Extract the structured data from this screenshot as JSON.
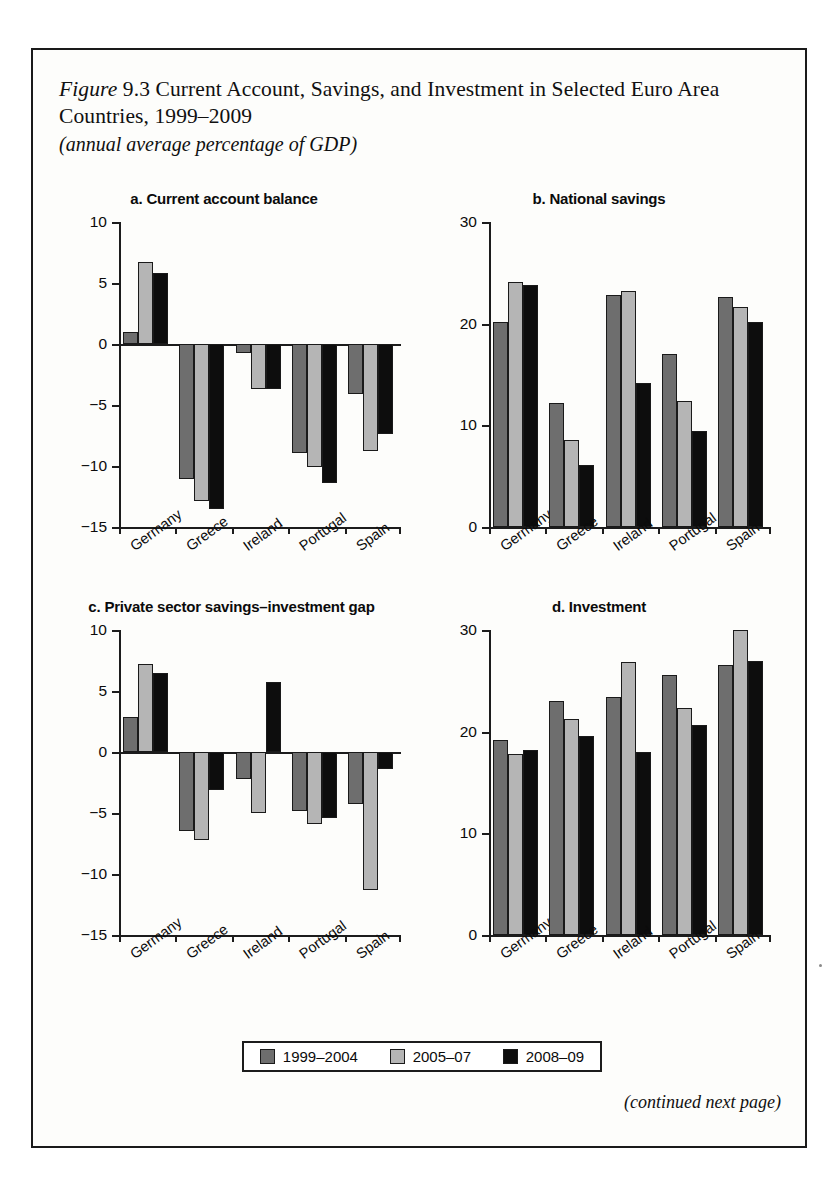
{
  "figure": {
    "label": "Figure",
    "number": "9.3",
    "title": "Current Account, Savings, and Investment in Selected Euro Area Countries, 1999–2009",
    "subtitle": "(annual average percentage of GDP)",
    "caption_line1": "Figure 9.3 Current Account, Savings, and Investment in",
    "caption_line2": "Selected Euro Area Countries, 1999–2009",
    "continued_note": "(continued next page)"
  },
  "legend": {
    "position": "bottom-center",
    "items": [
      {
        "label": "1999–2004",
        "color": "#6e6e6e"
      },
      {
        "label": "2005–07",
        "color": "#b5b5b5"
      },
      {
        "label": "2008–09",
        "color": "#0d0d0d"
      }
    ]
  },
  "colors": {
    "series1": "#6e6e6e",
    "series2": "#b5b5b5",
    "series3": "#0d0d0d",
    "axis": "#1c1c1c",
    "text": "#0b0b0b",
    "frame": "#1a1a1a"
  },
  "chart_data": [
    {
      "id": "panel-a",
      "type": "bar",
      "title": "a. Current account balance",
      "xlabel": "",
      "ylabel": "",
      "ylim": [
        -15,
        10
      ],
      "yticks": [
        10,
        5,
        0,
        -5,
        -10,
        -15
      ],
      "ytick_labels": [
        "10",
        "5",
        "0",
        "−5",
        "−10",
        "−15"
      ],
      "grid": false,
      "categories": [
        "Germany",
        "Greece",
        "Ireland",
        "Portugal",
        "Spain"
      ],
      "series": [
        {
          "name": "1999–2004",
          "values": [
            1.0,
            -11.1,
            -0.7,
            -8.9,
            -4.1
          ]
        },
        {
          "name": "2005–07",
          "values": [
            6.7,
            -12.9,
            -3.7,
            -10.1,
            -8.8
          ]
        },
        {
          "name": "2008–09",
          "values": [
            5.8,
            -13.5,
            -3.7,
            -11.4,
            -7.4
          ]
        }
      ]
    },
    {
      "id": "panel-b",
      "type": "bar",
      "title": "b. National savings",
      "xlabel": "",
      "ylabel": "",
      "ylim": [
        0,
        30
      ],
      "yticks": [
        30,
        20,
        10,
        0
      ],
      "ytick_labels": [
        "30",
        "20",
        "10",
        "0"
      ],
      "grid": false,
      "categories": [
        "Germany",
        "Greece",
        "Ireland",
        "Portugal",
        "Spain"
      ],
      "series": [
        {
          "name": "1999–2004",
          "values": [
            20.2,
            12.2,
            22.8,
            17.0,
            22.6
          ]
        },
        {
          "name": "2005–07",
          "values": [
            24.1,
            8.6,
            23.2,
            12.4,
            21.6
          ]
        },
        {
          "name": "2008–09",
          "values": [
            23.8,
            6.1,
            14.2,
            9.4,
            20.2
          ]
        }
      ]
    },
    {
      "id": "panel-c",
      "type": "bar",
      "title": "c. Private sector savings–investment gap",
      "xlabel": "",
      "ylabel": "",
      "ylim": [
        -15,
        10
      ],
      "yticks": [
        10,
        5,
        0,
        -5,
        -10,
        -15
      ],
      "ytick_labels": [
        "10",
        "5",
        "0",
        "−5",
        "−10",
        "−15"
      ],
      "grid": false,
      "categories": [
        "Germany",
        "Greece",
        "Ireland",
        "Portugal",
        "Spain"
      ],
      "series": [
        {
          "name": "1999–2004",
          "values": [
            2.9,
            -6.5,
            -2.2,
            -4.8,
            -4.3
          ]
        },
        {
          "name": "2005–07",
          "values": [
            7.2,
            -7.2,
            -5.0,
            -5.9,
            -11.3
          ]
        },
        {
          "name": "2008–09",
          "values": [
            6.5,
            -3.1,
            5.7,
            -5.4,
            -1.4
          ]
        }
      ]
    },
    {
      "id": "panel-d",
      "type": "bar",
      "title": "d. Investment",
      "xlabel": "",
      "ylabel": "",
      "ylim": [
        0,
        30
      ],
      "yticks": [
        30,
        20,
        10,
        0
      ],
      "ytick_labels": [
        "30",
        "20",
        "10",
        "0"
      ],
      "grid": false,
      "categories": [
        "Germany",
        "Greece",
        "Ireland",
        "Portugal",
        "Spain"
      ],
      "series": [
        {
          "name": "1999–2004",
          "values": [
            19.2,
            23.0,
            23.4,
            25.6,
            26.6
          ]
        },
        {
          "name": "2005–07",
          "values": [
            17.8,
            21.2,
            26.9,
            22.3,
            30.0
          ]
        },
        {
          "name": "2008–09",
          "values": [
            18.2,
            19.6,
            18.0,
            20.7,
            27.0
          ]
        }
      ]
    }
  ]
}
